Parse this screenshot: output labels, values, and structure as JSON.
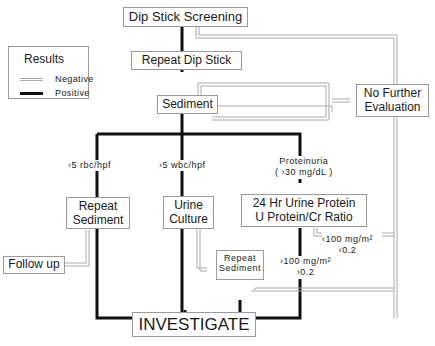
{
  "legend": {
    "title": "Results",
    "items": [
      {
        "label": "Negative",
        "style": "double-grey-line",
        "color": "#aaaaaa"
      },
      {
        "label": "Positive",
        "style": "thick-black-line",
        "color": "#111111"
      }
    ]
  },
  "nodes": {
    "dipstick_screening": "Dip Stick Screening",
    "repeat_dipstick": "Repeat Dip Stick",
    "sediment": "Sediment",
    "no_further_line1": "No Further",
    "no_further_line2": "Evaluation",
    "repeat_sediment_line1": "Repeat",
    "repeat_sediment_line2": "Sediment",
    "urine_culture_line1": "Urine",
    "urine_culture_line2": "Culture",
    "urine_protein_line1": "24 Hr Urine Protein",
    "urine_protein_line2": "U Protein/Cr Ratio",
    "follow_up": "Follow up",
    "repeat_sediment2_line1": "Repeat",
    "repeat_sediment2_line2": "Sediment",
    "investigate": "INVESTIGATE"
  },
  "edge_labels": {
    "rbc": "›5 rbc/hpf",
    "wbc": "›5 wbc/hpf",
    "proteinuria_line1": "Proteinuria",
    "proteinuria_line2": "( ›30 mg/dL )",
    "low_protein_line1": "‹100 mg/m²",
    "low_protein_line2": "‹0.2",
    "high_protein_line1": "›100 mg/m²",
    "high_protein_line2": "›0.2"
  },
  "colors": {
    "positive": "#111111",
    "negative": "#aaaaaa",
    "box_border": "#9a9a9a"
  }
}
